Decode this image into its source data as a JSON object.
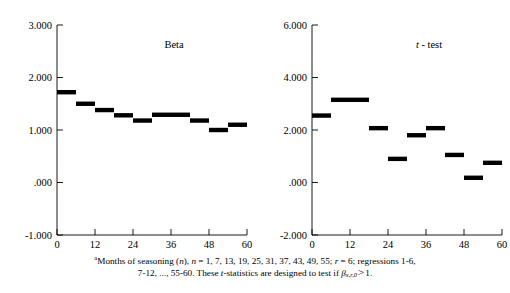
{
  "figure": {
    "footnote": {
      "marker": "a",
      "line1_pre": "Months of seasoning (",
      "line1_n_ital": "n",
      "line1_mid": "), ",
      "line1_n2_ital": "n",
      "line1_values": " = 1, 7, 13, 19, 25, 31, 37, 43, 49, 55; ",
      "line1_r_ital": "r",
      "line1_r_val": " = 6; regressions 1-6,",
      "line2_pre": "7-12, ..., 55-60. These ",
      "line2_t_ital": "t",
      "line2_mid": "-statistics are designed to test if ",
      "line2_beta": "β",
      "line2_sub": "x,r,0",
      "line2_gt": ">",
      "line2_end": "1."
    },
    "ink_color": "#000000"
  },
  "chart_data": [
    {
      "type": "bar",
      "title": "Beta",
      "xlabel": "",
      "ylabel": "",
      "xlim": [
        0,
        60
      ],
      "ylim": [
        -1.0,
        3.0
      ],
      "xticks": [
        0,
        12,
        24,
        36,
        48,
        60
      ],
      "xtick_labels": [
        "0",
        "12",
        "24",
        "36",
        "48",
        "60"
      ],
      "yticks": [
        -1.0,
        0.0,
        1.0,
        2.0,
        3.0
      ],
      "ytick_labels": [
        "-1.000",
        ".000",
        "1.000",
        "2.000",
        "3.000"
      ],
      "grid": false,
      "legend": "none",
      "orientation": "horizontal-step-segments",
      "categories": [
        "1-6",
        "7-12",
        "13-18",
        "19-24",
        "25-30",
        "31-36",
        "37-42",
        "43-48",
        "49-54",
        "55-60"
      ],
      "x_spans": [
        [
          0,
          6
        ],
        [
          6,
          12
        ],
        [
          12,
          18
        ],
        [
          18,
          24
        ],
        [
          24,
          30
        ],
        [
          30,
          36
        ],
        [
          36,
          42
        ],
        [
          42,
          48
        ],
        [
          48,
          54
        ],
        [
          54,
          60
        ]
      ],
      "values": [
        1.72,
        1.5,
        1.38,
        1.28,
        1.18,
        1.29,
        1.29,
        1.18,
        1.0,
        1.1
      ]
    },
    {
      "type": "bar",
      "title_italic": "t",
      "title_rest": " - test",
      "title": "t - test",
      "xlabel": "",
      "ylabel": "",
      "xlim": [
        0,
        60
      ],
      "ylim": [
        -2.0,
        6.0
      ],
      "xticks": [
        0,
        12,
        24,
        36,
        48,
        60
      ],
      "xtick_labels": [
        "0",
        "12",
        "24",
        "36",
        "48",
        "60"
      ],
      "yticks": [
        -2.0,
        0.0,
        2.0,
        4.0,
        6.0
      ],
      "ytick_labels": [
        "-2.000",
        ".000",
        "2.000",
        "4.000",
        "6.000"
      ],
      "grid": false,
      "legend": "none",
      "orientation": "horizontal-step-segments",
      "categories": [
        "1-6",
        "7-12",
        "13-18",
        "19-24",
        "25-30",
        "31-36",
        "37-42",
        "43-48",
        "49-54",
        "55-60"
      ],
      "x_spans": [
        [
          0,
          6
        ],
        [
          6,
          12
        ],
        [
          12,
          18
        ],
        [
          18,
          24
        ],
        [
          24,
          30
        ],
        [
          30,
          36
        ],
        [
          36,
          42
        ],
        [
          42,
          48
        ],
        [
          48,
          54
        ],
        [
          54,
          60
        ]
      ],
      "values": [
        2.55,
        3.15,
        3.15,
        2.07,
        0.9,
        1.8,
        2.07,
        1.05,
        0.18,
        0.75
      ]
    }
  ]
}
